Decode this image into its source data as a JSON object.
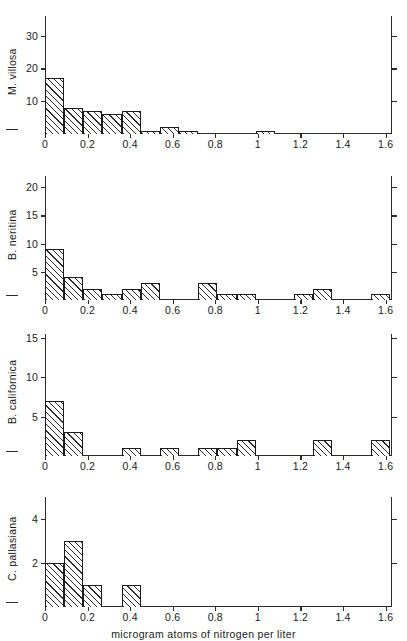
{
  "figure": {
    "xaxis_title": "microgram atoms of nitrogen per liter",
    "x_tick_labels": [
      "0",
      "0.2",
      "0.4",
      "0.6",
      "0.8",
      "1",
      "1.2",
      "1.4",
      "1.6"
    ],
    "x_tick_values": [
      0,
      0.2,
      0.4,
      0.6,
      0.8,
      1.0,
      1.2,
      1.4,
      1.6
    ]
  },
  "chart_data": [
    {
      "type": "bar",
      "title": "M. villosa",
      "panel_index": 0,
      "ylabel": "M. villosa",
      "xlabel": "microgram atoms of nitrogen per liter",
      "xlim": [
        0,
        1.63
      ],
      "ylim": [
        0,
        36
      ],
      "y_tick_labels": [
        "10",
        "20",
        "30"
      ],
      "y_tick_values": [
        10,
        20,
        30
      ],
      "bin_width": 0.09,
      "grid": false,
      "legend": "none",
      "bins": [
        {
          "x0": 0.0,
          "x1": 0.09,
          "value": 17
        },
        {
          "x0": 0.09,
          "x1": 0.18,
          "value": 8
        },
        {
          "x0": 0.18,
          "x1": 0.27,
          "value": 7
        },
        {
          "x0": 0.27,
          "x1": 0.36,
          "value": 6
        },
        {
          "x0": 0.36,
          "x1": 0.45,
          "value": 7
        },
        {
          "x0": 0.45,
          "x1": 0.54,
          "value": 1
        },
        {
          "x0": 0.54,
          "x1": 0.63,
          "value": 2
        },
        {
          "x0": 0.63,
          "x1": 0.72,
          "value": 1
        },
        {
          "x0": 0.99,
          "x1": 1.08,
          "value": 1
        }
      ]
    },
    {
      "type": "bar",
      "title": "B. neritina",
      "panel_index": 1,
      "ylabel": "B. neritina",
      "xlabel": "microgram atoms of nitrogen per liter",
      "xlim": [
        0,
        1.63
      ],
      "ylim": [
        0,
        22
      ],
      "y_tick_labels": [
        "5",
        "10",
        "15",
        "20"
      ],
      "y_tick_values": [
        5,
        10,
        15,
        20
      ],
      "bin_width": 0.09,
      "grid": false,
      "legend": "none",
      "bins": [
        {
          "x0": 0.0,
          "x1": 0.09,
          "value": 9
        },
        {
          "x0": 0.09,
          "x1": 0.18,
          "value": 4
        },
        {
          "x0": 0.18,
          "x1": 0.27,
          "value": 2
        },
        {
          "x0": 0.27,
          "x1": 0.36,
          "value": 1
        },
        {
          "x0": 0.36,
          "x1": 0.45,
          "value": 2
        },
        {
          "x0": 0.45,
          "x1": 0.54,
          "value": 3
        },
        {
          "x0": 0.72,
          "x1": 0.81,
          "value": 3
        },
        {
          "x0": 0.81,
          "x1": 0.9,
          "value": 1
        },
        {
          "x0": 0.9,
          "x1": 0.99,
          "value": 1
        },
        {
          "x0": 1.17,
          "x1": 1.26,
          "value": 1
        },
        {
          "x0": 1.26,
          "x1": 1.35,
          "value": 2
        },
        {
          "x0": 1.53,
          "x1": 1.62,
          "value": 1
        }
      ]
    },
    {
      "type": "bar",
      "title": "B. californica",
      "panel_index": 2,
      "ylabel": "B. californica",
      "xlabel": "microgram atoms of nitrogen per liter",
      "xlim": [
        0,
        1.63
      ],
      "ylim": [
        0,
        15.5
      ],
      "y_tick_labels": [
        "5",
        "10",
        "15"
      ],
      "y_tick_values": [
        5,
        10,
        15
      ],
      "bin_width": 0.09,
      "grid": false,
      "legend": "none",
      "bins": [
        {
          "x0": 0.0,
          "x1": 0.09,
          "value": 7
        },
        {
          "x0": 0.09,
          "x1": 0.18,
          "value": 3
        },
        {
          "x0": 0.36,
          "x1": 0.45,
          "value": 1
        },
        {
          "x0": 0.54,
          "x1": 0.63,
          "value": 1
        },
        {
          "x0": 0.72,
          "x1": 0.81,
          "value": 1
        },
        {
          "x0": 0.81,
          "x1": 0.9,
          "value": 1
        },
        {
          "x0": 0.9,
          "x1": 0.99,
          "value": 2
        },
        {
          "x0": 1.26,
          "x1": 1.35,
          "value": 2
        },
        {
          "x0": 1.53,
          "x1": 1.62,
          "value": 2
        }
      ]
    },
    {
      "type": "bar",
      "title": "C. pallasiana",
      "panel_index": 3,
      "ylabel": "C. pallasiana",
      "xlabel": "microgram atoms of nitrogen per liter",
      "xlim": [
        0,
        1.63
      ],
      "ylim": [
        0,
        5
      ],
      "y_tick_labels": [
        "2",
        "4"
      ],
      "y_tick_values": [
        2,
        4
      ],
      "bin_width": 0.09,
      "grid": false,
      "legend": "none",
      "bins": [
        {
          "x0": 0.0,
          "x1": 0.09,
          "value": 2
        },
        {
          "x0": 0.09,
          "x1": 0.18,
          "value": 3
        },
        {
          "x0": 0.18,
          "x1": 0.27,
          "value": 1
        },
        {
          "x0": 0.36,
          "x1": 0.45,
          "value": 1
        }
      ]
    }
  ]
}
